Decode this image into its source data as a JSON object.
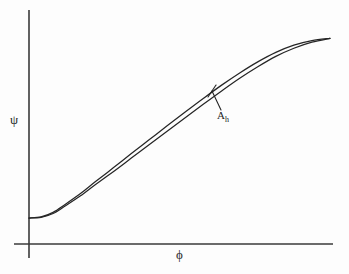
{
  "figure": {
    "background_color": "#fdfdfd",
    "axis_color": "#3a3a3a",
    "curve_color": "#262626",
    "y_axis_label": "ψ",
    "x_axis_label": "ϕ",
    "annotation": {
      "symbol": "A",
      "subscript": "h"
    }
  },
  "chart_data": {
    "type": "line",
    "title": "",
    "xlabel": "ϕ",
    "ylabel": "ψ",
    "xlim": [
      0,
      1
    ],
    "ylim": [
      0,
      1
    ],
    "grid": false,
    "legend": "none",
    "annotations": [
      {
        "text": "A_h",
        "label": "A",
        "subscript": "h",
        "points_to_x": 0.6,
        "points_to_y": 0.65,
        "description": "leader line from label to the gap between the two branches"
      }
    ],
    "series": [
      {
        "name": "upper-branch",
        "x": [
          0.0,
          0.04,
          0.08,
          0.12,
          0.17,
          0.22,
          0.28,
          0.34,
          0.4,
          0.46,
          0.52,
          0.58,
          0.64,
          0.7,
          0.76,
          0.82,
          0.88,
          0.94,
          1.0
        ],
        "y": [
          0.115,
          0.12,
          0.14,
          0.175,
          0.222,
          0.275,
          0.337,
          0.4,
          0.462,
          0.524,
          0.585,
          0.645,
          0.703,
          0.757,
          0.806,
          0.848,
          0.88,
          0.9,
          0.91
        ]
      },
      {
        "name": "lower-branch",
        "x": [
          0.0,
          0.04,
          0.08,
          0.12,
          0.17,
          0.22,
          0.28,
          0.34,
          0.4,
          0.46,
          0.52,
          0.58,
          0.64,
          0.7,
          0.76,
          0.82,
          0.88,
          0.94,
          1.0
        ],
        "y": [
          0.115,
          0.118,
          0.135,
          0.168,
          0.212,
          0.262,
          0.32,
          0.38,
          0.44,
          0.5,
          0.56,
          0.619,
          0.677,
          0.733,
          0.784,
          0.83,
          0.866,
          0.893,
          0.91
        ]
      }
    ]
  }
}
